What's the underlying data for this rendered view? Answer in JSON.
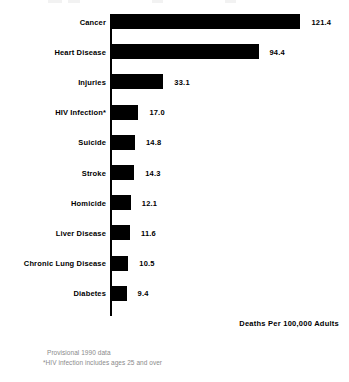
{
  "chart_data": {
    "type": "bar",
    "orientation": "horizontal",
    "title": "",
    "xlabel": "Deaths Per 100,000 Adults",
    "ylabel": "",
    "categories": [
      "Cancer",
      "Heart Disease",
      "Injuries",
      "HIV Infection*",
      "Suicide",
      "Stroke",
      "Homicide",
      "Liver Disease",
      "Chronic Lung Disease",
      "Diabetes"
    ],
    "values": [
      121.4,
      94.4,
      33.1,
      17.0,
      14.8,
      14.3,
      12.1,
      11.6,
      10.5,
      9.4
    ],
    "value_labels": [
      "121.4",
      "94.4",
      "33.1",
      "17.0",
      "14.8",
      "14.3",
      "12.1",
      "11.6",
      "10.5",
      "9.4"
    ],
    "xlim": [
      0,
      121.4
    ],
    "grid": false,
    "legend": null,
    "bar_color": "#000000",
    "background_color": "#ffffff"
  },
  "axis": {
    "title": "Deaths Per 100,000 Adults"
  },
  "footnote": {
    "line1": "Provisional 1990 data",
    "line2": "*HIV infection includes ages 25 and over"
  }
}
